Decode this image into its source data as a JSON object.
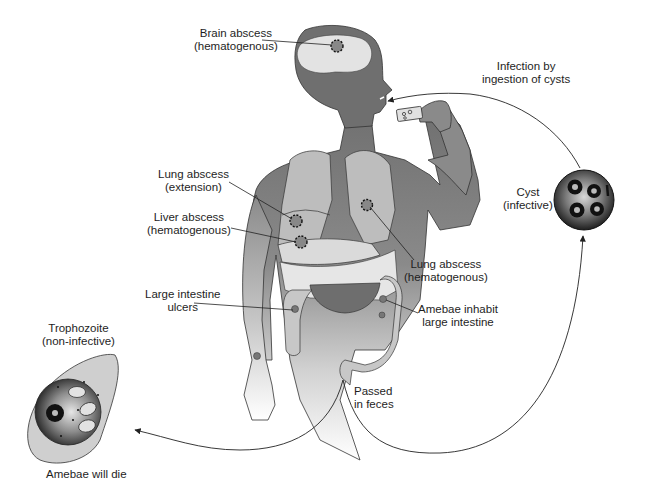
{
  "diagram": {
    "type": "life-cycle",
    "colors": {
      "background": "#ffffff",
      "body_skin": "#7d7d7d",
      "body_light": "#c9c9c9",
      "organ_light": "#dcdcdc",
      "stomach": "#6e6e6e",
      "line": "#222222"
    }
  },
  "labels": {
    "brain": {
      "line1": "Brain abscess",
      "line2": "(hematogenous)"
    },
    "ingestion": {
      "line1": "Infection by",
      "line2": "ingestion of cysts"
    },
    "lung_ext": {
      "line1": "Lung abscess",
      "line2": "(extension)"
    },
    "liver": {
      "line1": "Liver abscess",
      "line2": "(hematogenous)"
    },
    "lung_hem": {
      "line1": "Lung abscess",
      "line2": "(hematogenous)"
    },
    "cyst": {
      "line1": "Cyst",
      "line2": "(infective)"
    },
    "ulcers": {
      "line1": "Large intestine",
      "line2": "ulcers"
    },
    "amebae": {
      "line1": "Amebae inhabit",
      "line2": "large intestine"
    },
    "trophozoite": {
      "line1": "Trophozoite",
      "line2": "(non-infective)"
    },
    "feces": {
      "line1": "Passed",
      "line2": "in feces"
    },
    "die": {
      "line1": "Amebae will die"
    }
  }
}
